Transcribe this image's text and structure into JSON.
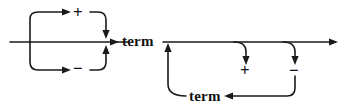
{
  "diagram": {
    "kind": "railroad-syntax-diagram",
    "stroke_color": "#1a1a1a",
    "background_color": "#ffffff",
    "width": 345,
    "height": 110,
    "tokens": {
      "term_main": "term",
      "term_loop": "term",
      "plus_left": "+",
      "minus_left": "−",
      "plus_right": "+",
      "minus_right": "−"
    },
    "left_group": {
      "description": "optional leading sign before first term",
      "alternatives": [
        "+",
        "−"
      ],
      "entry_label": "",
      "exit_label": "term"
    },
    "right_group": {
      "description": "repeated sign followed by term",
      "alternatives": [
        "+",
        "−"
      ],
      "loop_label": "term"
    },
    "icons": {
      "arrow_right": "arrow-right-icon",
      "arrow_left": "arrow-left-icon",
      "arrow_down": "arrow-down-icon",
      "arrow_up": "arrow-up-icon"
    }
  }
}
